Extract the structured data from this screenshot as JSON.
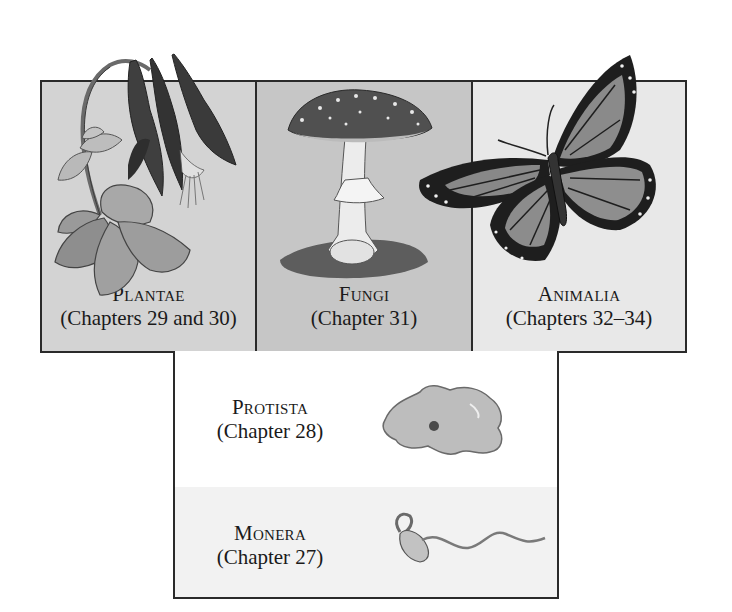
{
  "diagram": {
    "type": "kingdom-classification",
    "top_row": [
      {
        "kingdom": "Plantae",
        "chapters": "(Chapters 29 and 30)",
        "illustration": "columbine-flower"
      },
      {
        "kingdom": "Fungi",
        "chapters": "(Chapter 31)",
        "illustration": "mushroom"
      },
      {
        "kingdom": "Animalia",
        "chapters": "(Chapters 32–34)",
        "illustration": "monarch-butterfly"
      }
    ],
    "bottom_stack": [
      {
        "kingdom": "Protista",
        "chapters": "(Chapter 28)",
        "illustration": "amoeba"
      },
      {
        "kingdom": "Monera",
        "chapters": "(Chapter 27)",
        "illustration": "spirochete-bacterium"
      }
    ],
    "colors": {
      "border": "#2a2a2a",
      "plantae_bg": "#d3d3d3",
      "fungi_bg": "#c6c6c6",
      "animalia_bg": "#e8e8e8",
      "protista_bg": "#ffffff",
      "monera_bg": "#f2f2f2"
    }
  }
}
